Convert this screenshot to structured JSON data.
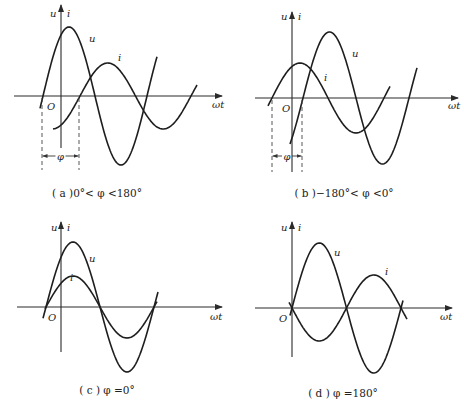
{
  "figure": {
    "panels": [
      {
        "id": "a",
        "caption": "( a )0°< φ <180°",
        "caption_pos": [
          97,
          197
        ],
        "axis": {
          "x0": 14,
          "x1": 222,
          "y": 96,
          "ox": 61,
          "ytop": 5,
          "ybot": 148
        },
        "labels": {
          "y_axis": "u",
          "y_axis2": "i",
          "origin": "O",
          "x_axis": "ωt",
          "u": "u",
          "i": "i",
          "phi": "φ"
        },
        "label_pos": {
          "y_axis": [
            50,
            17
          ],
          "y_axis2": [
            67,
            17
          ],
          "origin": [
            47,
            110
          ],
          "x_axis": [
            212,
            108
          ],
          "u": [
            89,
            42
          ],
          "i": [
            118,
            61
          ]
        },
        "u_curve": {
          "start": 40,
          "end": 157,
          "zero": 43,
          "period": 104,
          "amp": 69,
          "y0": 96
        },
        "i_curve": {
          "start": 53,
          "end": 197,
          "zero": 80,
          "period": 111,
          "amp": 33,
          "y0": 96
        },
        "phi_marker": {
          "x1": 42,
          "x2": 79,
          "ytop": 98,
          "ybot": 170,
          "yarrow": 156
        }
      },
      {
        "id": "b",
        "caption": "( b )−180°< φ <0°",
        "caption_pos": [
          344,
          197
        ],
        "axis": {
          "x0": 255,
          "x1": 458,
          "y": 98,
          "ox": 292,
          "ytop": 12,
          "ybot": 172
        },
        "labels": {
          "y_axis": "u",
          "y_axis2": "i",
          "origin": "O",
          "x_axis": "ωt",
          "u": "u",
          "i": "i",
          "phi": "φ"
        },
        "label_pos": {
          "y_axis": [
            281,
            20
          ],
          "y_axis2": [
            298,
            20
          ],
          "origin": [
            282,
            112
          ],
          "x_axis": [
            448,
            109
          ],
          "u": [
            352,
            57
          ],
          "i": [
            324,
            81
          ]
        },
        "u_curve": {
          "start": 290,
          "end": 417,
          "zero": 303,
          "period": 106,
          "amp": 66,
          "y0": 98
        },
        "i_curve": {
          "start": 268,
          "end": 390,
          "zero": 272,
          "period": 112,
          "amp": 35,
          "y0": 98
        },
        "phi_marker": {
          "x1": 272,
          "x2": 302,
          "ytop": 100,
          "ybot": 172,
          "yarrow": 156
        }
      },
      {
        "id": "c",
        "caption": "( c ) φ =0°",
        "caption_pos": [
          107,
          394
        ],
        "axis": {
          "x0": 17,
          "x1": 222,
          "y": 307,
          "ox": 61,
          "ytop": 222,
          "ybot": 352
        },
        "labels": {
          "y_axis": "u",
          "y_axis2": "i",
          "origin": "O",
          "x_axis": "ωt",
          "u": "u",
          "i": "i"
        },
        "label_pos": {
          "y_axis": [
            51,
            231
          ],
          "y_axis2": [
            67,
            231
          ],
          "origin": [
            48,
            321
          ],
          "x_axis": [
            210,
            320
          ],
          "u": [
            89,
            262
          ],
          "i": [
            70,
            281
          ]
        },
        "u_curve": {
          "start": 43,
          "end": 158,
          "zero": 46,
          "period": 108,
          "amp": 65,
          "y0": 307
        },
        "i_curve": {
          "start": 45,
          "end": 157,
          "zero": 46,
          "period": 108,
          "amp": 31,
          "y0": 307
        },
        "phi_marker": null
      },
      {
        "id": "d",
        "caption": "( d ) φ =180°",
        "caption_pos": [
          343,
          397
        ],
        "axis": {
          "x0": 255,
          "x1": 452,
          "y": 308,
          "ox": 292,
          "ytop": 222,
          "ybot": 357
        },
        "labels": {
          "y_axis": "u",
          "y_axis2": "i",
          "origin": "O",
          "x_axis": "ωt",
          "u": "u",
          "i": "i"
        },
        "label_pos": {
          "y_axis": [
            281,
            231
          ],
          "y_axis2": [
            298,
            231
          ],
          "origin": [
            279,
            322
          ],
          "x_axis": [
            440,
            320
          ],
          "u": [
            334,
            256
          ],
          "i": [
            385,
            275
          ]
        },
        "u_curve": {
          "start": 290,
          "end": 403,
          "zero": 292,
          "period": 109,
          "amp": 65,
          "y0": 308
        },
        "i_curve": {
          "start": 289,
          "end": 407,
          "zero": 292,
          "period": 109,
          "amp": -33,
          "y0": 308
        },
        "phi_marker": null
      }
    ]
  },
  "styles": {
    "line_color": "#1e1e1e",
    "background": "#ffffff"
  }
}
